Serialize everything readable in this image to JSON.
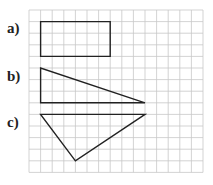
{
  "labels": {
    "a": "a)",
    "b": "b)",
    "c": "c)"
  },
  "grid": {
    "columns": 15,
    "rows": 14,
    "cell_px": 11.6,
    "origin_px": [
      29,
      10
    ],
    "line_color": "#c8c8c8",
    "shape_color": "#222222"
  },
  "shapes": [
    {
      "id": "a",
      "type": "rectangle",
      "grid_points": [
        [
          1,
          1
        ],
        [
          7,
          1
        ],
        [
          7,
          4
        ],
        [
          1,
          4
        ]
      ]
    },
    {
      "id": "b",
      "type": "right-triangle",
      "grid_points": [
        [
          1,
          5
        ],
        [
          1,
          8
        ],
        [
          10,
          8
        ]
      ]
    },
    {
      "id": "c",
      "type": "triangle",
      "grid_points": [
        [
          1,
          9
        ],
        [
          10,
          9
        ],
        [
          4,
          13
        ]
      ]
    }
  ]
}
